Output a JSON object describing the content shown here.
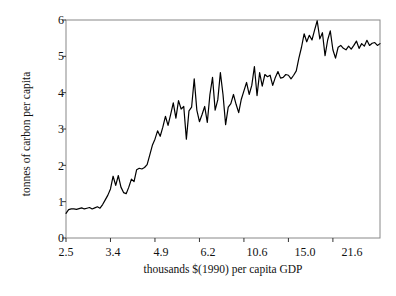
{
  "chart_data": {
    "type": "line",
    "title": "",
    "subtitle": "",
    "xlabel": "thousands $(1990) per capita GDP",
    "ylabel": "tonnes of carbon per capita",
    "xtick_labels": [
      "2.5",
      "3.4",
      "4.9",
      "6.2",
      "10.6",
      "15.0",
      "21.6"
    ],
    "ytick_labels": [
      "0",
      "1",
      "2",
      "3",
      "4",
      "5",
      "6"
    ],
    "ylim": [
      0,
      6
    ],
    "xlim_index": [
      0,
      120
    ],
    "x_axis_kind": "ordinal-binned",
    "xtick_index_positions": [
      0,
      17,
      34,
      51,
      68,
      85,
      102
    ],
    "grid": false,
    "legend": null,
    "annotations": [],
    "line_color": "#000000",
    "line_width": 1.2,
    "frame_color": "#888888",
    "background": "#ffffff",
    "series": [
      {
        "name": "carbon per capita vs GDP",
        "values": [
          0.68,
          0.78,
          0.8,
          0.8,
          0.79,
          0.81,
          0.83,
          0.8,
          0.82,
          0.84,
          0.8,
          0.83,
          0.86,
          0.82,
          0.92,
          1.05,
          1.18,
          1.35,
          1.7,
          1.45,
          1.72,
          1.4,
          1.25,
          1.22,
          1.4,
          1.62,
          1.55,
          1.88,
          1.92,
          1.9,
          1.94,
          2.02,
          2.28,
          2.55,
          2.72,
          2.95,
          2.8,
          3.05,
          3.35,
          3.1,
          3.4,
          3.72,
          3.3,
          3.78,
          3.55,
          3.62,
          2.72,
          3.5,
          3.6,
          4.38,
          3.52,
          3.2,
          3.4,
          3.62,
          3.18,
          3.95,
          4.42,
          3.52,
          3.8,
          4.55,
          3.95,
          3.12,
          3.6,
          3.7,
          3.95,
          3.68,
          3.45,
          3.82,
          4.05,
          4.28,
          3.95,
          4.2,
          4.72,
          3.92,
          4.55,
          4.18,
          4.5,
          4.44,
          4.48,
          4.2,
          4.42,
          4.58,
          4.4,
          4.42,
          4.5,
          4.48,
          4.38,
          4.48,
          4.6,
          4.95,
          5.25,
          5.62,
          5.4,
          5.58,
          5.45,
          5.72,
          5.98,
          5.48,
          5.65,
          5.02,
          5.45,
          5.7,
          5.18,
          4.95,
          5.25,
          5.3,
          5.22,
          5.18,
          5.28,
          5.2,
          5.3,
          5.42,
          5.22,
          5.35,
          5.28,
          5.44,
          5.3,
          5.36,
          5.38,
          5.3,
          5.35
        ]
      }
    ]
  }
}
